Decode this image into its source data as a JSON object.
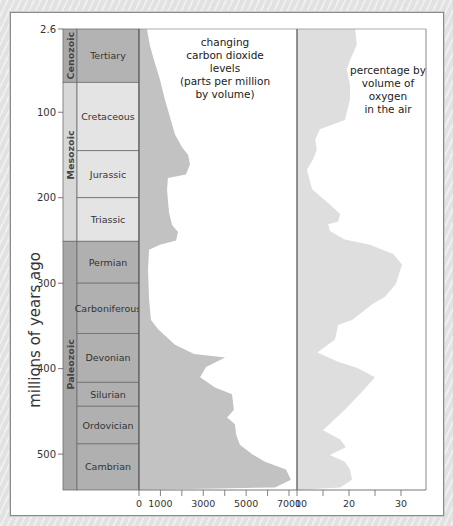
{
  "chart_data": {
    "type": "area",
    "title": "",
    "ylabel": "millions of years ago",
    "y_axis": {
      "ticks": [
        2.6,
        100,
        200,
        300,
        400,
        500
      ],
      "range": [
        2.6,
        542
      ],
      "inverted": true
    },
    "geologic_timescale": {
      "eras": [
        {
          "name": "Cenozoic",
          "start": 2.6,
          "end": 65
        },
        {
          "name": "Mesozoic",
          "start": 65,
          "end": 251
        },
        {
          "name": "Paleozoic",
          "start": 251,
          "end": 542
        }
      ],
      "periods": [
        {
          "name": "Tertiary",
          "start": 2.6,
          "end": 65
        },
        {
          "name": "Cretaceous",
          "start": 65,
          "end": 145
        },
        {
          "name": "Jurassic",
          "start": 145,
          "end": 200
        },
        {
          "name": "Triassic",
          "start": 200,
          "end": 251
        },
        {
          "name": "Permian",
          "start": 251,
          "end": 300
        },
        {
          "name": "Carboniferous",
          "start": 300,
          "end": 359
        },
        {
          "name": "Devonian",
          "start": 359,
          "end": 416
        },
        {
          "name": "Silurian",
          "start": 416,
          "end": 444
        },
        {
          "name": "Ordovician",
          "start": 444,
          "end": 488
        },
        {
          "name": "Cambrian",
          "start": 488,
          "end": 542
        }
      ]
    },
    "series": [
      {
        "name": "changing carbon dioxide levels (parts per million by volume)",
        "x_axis": {
          "ticks": [
            0,
            1000,
            3000,
            5000,
            7000
          ],
          "minor_ticks": [
            2000,
            4000,
            6000
          ],
          "range": [
            0,
            7300
          ]
        },
        "points": [
          {
            "age": 2.6,
            "value": 370
          },
          {
            "age": 22,
            "value": 510
          },
          {
            "age": 39,
            "value": 700
          },
          {
            "age": 62,
            "value": 980
          },
          {
            "age": 85,
            "value": 1210
          },
          {
            "age": 106,
            "value": 1450
          },
          {
            "age": 126,
            "value": 1680
          },
          {
            "age": 141,
            "value": 2010
          },
          {
            "age": 150,
            "value": 2290
          },
          {
            "age": 161,
            "value": 2380
          },
          {
            "age": 173,
            "value": 2190
          },
          {
            "age": 177,
            "value": 1350
          },
          {
            "age": 191,
            "value": 1310
          },
          {
            "age": 203,
            "value": 1350
          },
          {
            "age": 217,
            "value": 1400
          },
          {
            "age": 232,
            "value": 1540
          },
          {
            "age": 240,
            "value": 1820
          },
          {
            "age": 250,
            "value": 1730
          },
          {
            "age": 255,
            "value": 980
          },
          {
            "age": 261,
            "value": 470
          },
          {
            "age": 284,
            "value": 420
          },
          {
            "age": 319,
            "value": 470
          },
          {
            "age": 343,
            "value": 560
          },
          {
            "age": 354,
            "value": 890
          },
          {
            "age": 372,
            "value": 1680
          },
          {
            "age": 383,
            "value": 2570
          },
          {
            "age": 387,
            "value": 4020
          },
          {
            "age": 398,
            "value": 3130
          },
          {
            "age": 410,
            "value": 2850
          },
          {
            "age": 422,
            "value": 3550
          },
          {
            "age": 430,
            "value": 4340
          },
          {
            "age": 448,
            "value": 4430
          },
          {
            "age": 457,
            "value": 4110
          },
          {
            "age": 465,
            "value": 4480
          },
          {
            "age": 477,
            "value": 4530
          },
          {
            "age": 489,
            "value": 4710
          },
          {
            "age": 500,
            "value": 5270
          },
          {
            "age": 509,
            "value": 5880
          },
          {
            "age": 518,
            "value": 6860
          },
          {
            "age": 530,
            "value": 7090
          },
          {
            "age": 539,
            "value": 6340
          },
          {
            "age": 542,
            "value": 0
          }
        ]
      },
      {
        "name": "percentage by volume of oxygen in the air",
        "x_axis": {
          "ticks": [
            10,
            20,
            30
          ],
          "minor_ticks": [
            15,
            25
          ],
          "range": [
            10,
            35
          ]
        },
        "points": [
          {
            "age": 2.6,
            "value": 21.2
          },
          {
            "age": 21,
            "value": 21.5
          },
          {
            "age": 39,
            "value": 20.2
          },
          {
            "age": 50,
            "value": 19.6
          },
          {
            "age": 68,
            "value": 20.2
          },
          {
            "age": 85,
            "value": 20.2
          },
          {
            "age": 109,
            "value": 19.2
          },
          {
            "age": 120,
            "value": 14.4
          },
          {
            "age": 132,
            "value": 13.5
          },
          {
            "age": 144,
            "value": 13.8
          },
          {
            "age": 155,
            "value": 13.1
          },
          {
            "age": 167,
            "value": 11.9
          },
          {
            "age": 190,
            "value": 12.9
          },
          {
            "age": 208,
            "value": 16.3
          },
          {
            "age": 219,
            "value": 18.3
          },
          {
            "age": 228,
            "value": 17.9
          },
          {
            "age": 231,
            "value": 16.0
          },
          {
            "age": 239,
            "value": 16.3
          },
          {
            "age": 249,
            "value": 19.2
          },
          {
            "age": 255,
            "value": 24.0
          },
          {
            "age": 266,
            "value": 28.5
          },
          {
            "age": 278,
            "value": 30.2
          },
          {
            "age": 301,
            "value": 29.0
          },
          {
            "age": 316,
            "value": 26.9
          },
          {
            "age": 325,
            "value": 24.4
          },
          {
            "age": 343,
            "value": 20.6
          },
          {
            "age": 349,
            "value": 17.9
          },
          {
            "age": 366,
            "value": 17.3
          },
          {
            "age": 381,
            "value": 13.9
          },
          {
            "age": 392,
            "value": 17.9
          },
          {
            "age": 399,
            "value": 21.5
          },
          {
            "age": 410,
            "value": 25.0
          },
          {
            "age": 427,
            "value": 22.5
          },
          {
            "age": 448,
            "value": 19.2
          },
          {
            "age": 472,
            "value": 15.0
          },
          {
            "age": 483,
            "value": 18.3
          },
          {
            "age": 492,
            "value": 19.4
          },
          {
            "age": 501,
            "value": 16.3
          },
          {
            "age": 509,
            "value": 19.2
          },
          {
            "age": 518,
            "value": 20.2
          },
          {
            "age": 530,
            "value": 20.6
          },
          {
            "age": 539,
            "value": 18.3
          },
          {
            "age": 542,
            "value": 10
          }
        ]
      }
    ],
    "annotations": [
      "changing carbon dioxide levels (parts per million by volume)",
      "percentage by volume of oxygen in the air"
    ],
    "grid": false,
    "legend": "none (inline panel annotations)"
  },
  "labels": {
    "y_axis_title": "millions of years ago",
    "y_ticks": [
      "2.6",
      "100",
      "200",
      "300",
      "400",
      "500"
    ],
    "co2_ticks": [
      "0",
      "1000",
      "3000",
      "5000",
      "7000"
    ],
    "o2_ticks": [
      "10",
      "20",
      "30"
    ],
    "eras": [
      "Cenozoic",
      "Mesozoic",
      "Paleozoic"
    ],
    "periods": [
      "Tertiary",
      "Cretaceous",
      "Jurassic",
      "Triassic",
      "Permian",
      "Carboniferous",
      "Devonian",
      "Silurian",
      "Ordovician",
      "Cambrian"
    ],
    "co2_annotation": [
      "changing",
      "carbon dioxide",
      "levels",
      "(parts per million",
      "by volume)"
    ],
    "o2_annotation": [
      "percentage by",
      "volume of",
      "oxygen",
      "in the air"
    ]
  },
  "colors": {
    "era_cenozoic": "#a9a9a9",
    "period_cenozoic": "#b3b3b3",
    "era_mesozoic": "#d8d8d8",
    "period_mesozoic": "#e4e4e4",
    "era_paleozoic": "#a6a6a6",
    "period_paleozoic": "#b0b0b0",
    "co2_fill": "#c2c2c2",
    "o2_fill": "#dedede",
    "axis": "#777777"
  }
}
